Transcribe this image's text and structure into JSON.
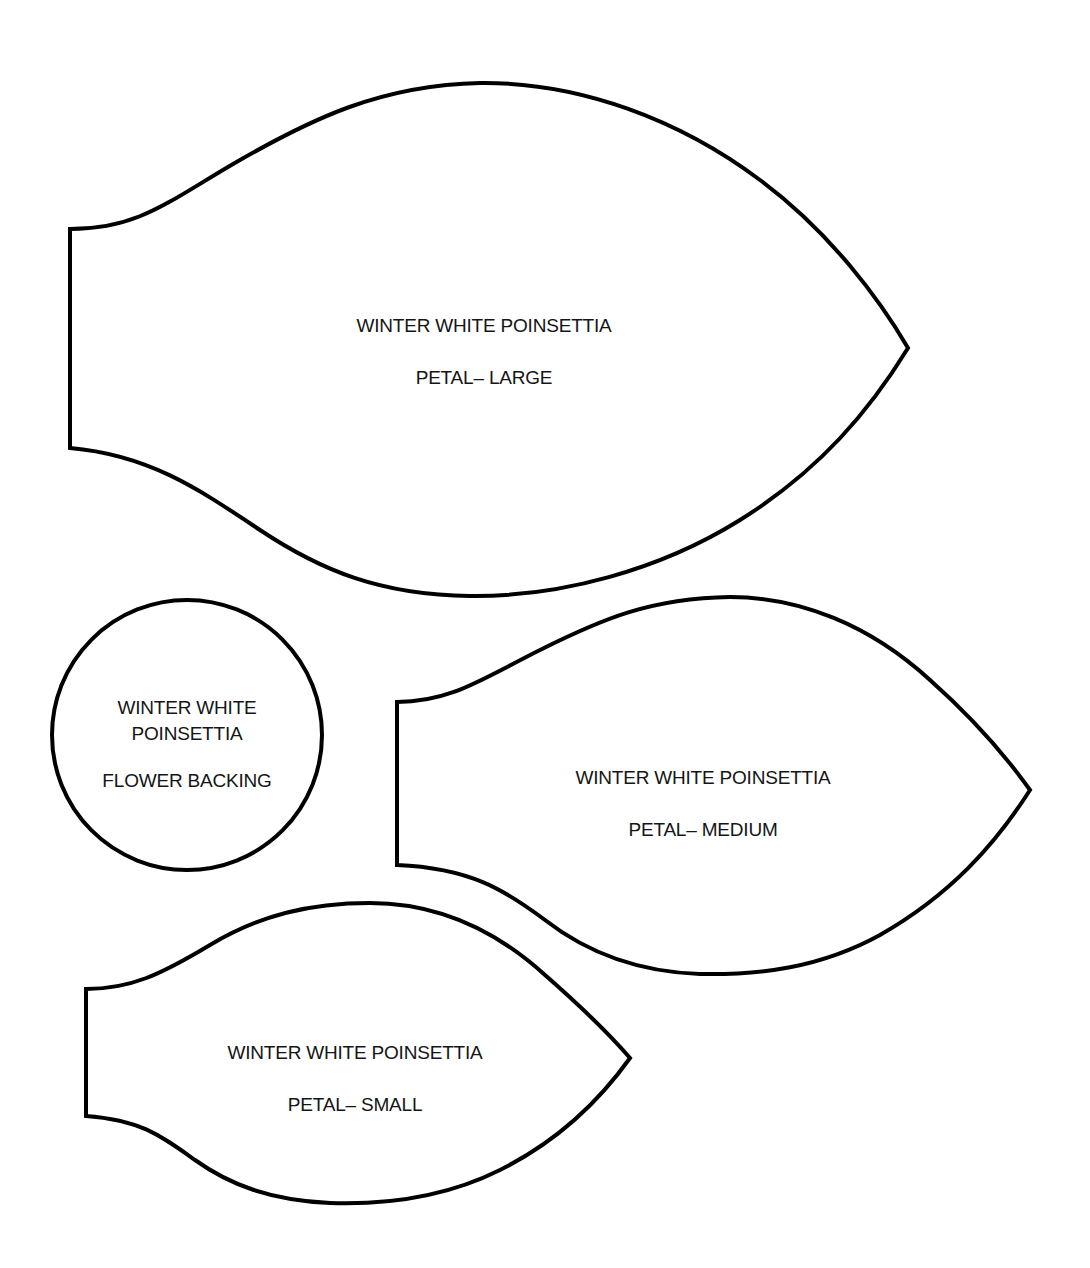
{
  "document": {
    "title": "Winter White Poinsettia Templates",
    "stroke_color": "#000000",
    "background_color": "#ffffff"
  },
  "templates": {
    "petal_large": {
      "line1": "WINTER WHITE POINSETTIA",
      "line2": "PETAL– LARGE"
    },
    "flower_backing": {
      "line1": "WINTER WHITE",
      "line2": "POINSETTIA",
      "line3": "FLOWER BACKING"
    },
    "petal_medium": {
      "line1": "WINTER WHITE POINSETTIA",
      "line2": "PETAL– MEDIUM"
    },
    "petal_small": {
      "line1": "WINTER WHITE POINSETTIA",
      "line2": "PETAL– SMALL"
    }
  }
}
